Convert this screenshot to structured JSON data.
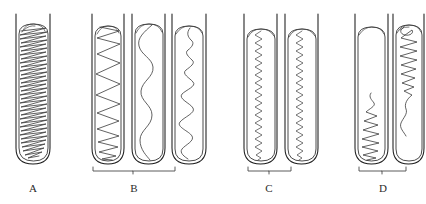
{
  "figure": {
    "title": "",
    "background_color": "#ffffff",
    "ink_color": "#1d1d1d",
    "trace_color": "#3a3a3a"
  },
  "groups": [
    {
      "id": "A",
      "label": "A",
      "label_x": 33,
      "label_y": 188,
      "bracket": false,
      "bracket_x1": 0,
      "bracket_x2": 0,
      "tube_count": 1,
      "pattern": "dense-uniform-zigzag-full-length"
    },
    {
      "id": "B",
      "label": "B",
      "label_x": 134,
      "label_y": 188,
      "bracket": true,
      "bracket_x1": 93,
      "bracket_x2": 175,
      "bracket_y": 171,
      "tube_count": 3,
      "pattern": "mixed-coarse-zigzag-smooth-wave-irregular"
    },
    {
      "id": "C",
      "label": "C",
      "label_x": 269,
      "label_y": 188,
      "bracket": true,
      "bracket_x1": 248,
      "bracket_x2": 291,
      "bracket_y": 171,
      "tube_count": 2,
      "pattern": "tight-narrow-zigzag-full-length"
    },
    {
      "id": "D",
      "label": "D",
      "label_x": 383,
      "label_y": 188,
      "bracket": true,
      "bracket_x1": 359,
      "bracket_x2": 406,
      "bracket_y": 171,
      "tube_count": 2,
      "pattern": "partial-zigzag-half-filled"
    }
  ],
  "tubes": [
    {
      "index": 0,
      "group": "A",
      "name": "tube-a1",
      "wall_left_x": 16,
      "wall_right_x": 50,
      "wall_top_y": 14,
      "content_top_y": 24,
      "content_bottom_y": 163,
      "content_left_x": 19,
      "content_right_x": 48,
      "trace_type": "dense-zigzag",
      "cycles": 22,
      "amplitude": "full-width"
    },
    {
      "index": 1,
      "group": "B",
      "name": "tube-b1",
      "wall_left_x": 92,
      "wall_right_x": 124,
      "wall_top_y": 14,
      "content_top_y": 26,
      "content_bottom_y": 163,
      "content_left_x": 95,
      "content_right_x": 122,
      "trace_type": "coarse-zigzag-tightening-downward",
      "cycles": 11,
      "amplitude": "full-width"
    },
    {
      "index": 2,
      "group": "B",
      "name": "tube-b2",
      "wall_left_x": 132,
      "wall_right_x": 165,
      "wall_top_y": 14,
      "content_top_y": 24,
      "content_bottom_y": 163,
      "content_left_x": 135,
      "content_right_x": 163,
      "trace_type": "smooth-sinusoidal-wave",
      "cycles": 6,
      "amplitude": "medium"
    },
    {
      "index": 3,
      "group": "B",
      "name": "tube-b3",
      "wall_left_x": 172,
      "wall_right_x": 206,
      "wall_top_y": 14,
      "content_top_y": 26,
      "content_bottom_y": 163,
      "content_left_x": 175,
      "content_right_x": 204,
      "trace_type": "irregular-tight-wave",
      "cycles": 13,
      "amplitude": "variable"
    },
    {
      "index": 4,
      "group": "C",
      "name": "tube-c1",
      "wall_left_x": 244,
      "wall_right_x": 277,
      "wall_top_y": 14,
      "content_top_y": 29,
      "content_bottom_y": 163,
      "content_left_x": 247,
      "content_right_x": 275,
      "trace_type": "tight-narrow-zigzag",
      "cycles": 34,
      "amplitude": "narrow"
    },
    {
      "index": 5,
      "group": "C",
      "name": "tube-c2",
      "wall_left_x": 285,
      "wall_right_x": 318,
      "wall_top_y": 14,
      "content_top_y": 29,
      "content_bottom_y": 163,
      "content_left_x": 288,
      "content_right_x": 316,
      "trace_type": "tight-narrow-zigzag",
      "cycles": 34,
      "amplitude": "narrow"
    },
    {
      "index": 6,
      "group": "D",
      "name": "tube-d1",
      "wall_left_x": 355,
      "wall_right_x": 388,
      "wall_top_y": 14,
      "content_top_y": 27,
      "content_bottom_y": 163,
      "content_left_x": 358,
      "content_right_x": 386,
      "trace_type": "lower-half-zigzag",
      "cycles": 16,
      "amplitude": "increasing-downward"
    },
    {
      "index": 7,
      "group": "D",
      "name": "tube-d2",
      "wall_left_x": 393,
      "wall_right_x": 424,
      "wall_top_y": 14,
      "content_top_y": 25,
      "content_bottom_y": 163,
      "content_left_x": 396,
      "content_right_x": 422,
      "trace_type": "upper-half-zigzag",
      "cycles": 15,
      "amplitude": "decreasing-downward"
    }
  ],
  "labels": {
    "a": "A",
    "b": "B",
    "c": "C",
    "d": "D"
  }
}
